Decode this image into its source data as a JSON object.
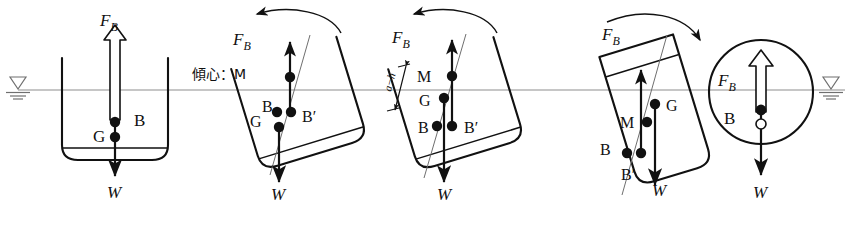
{
  "figure": {
    "background_color": "#ffffff",
    "line_color": "#111111",
    "waterline_color": "#8d8d8d",
    "width": 862,
    "height": 230,
    "waterline_y": 90,
    "caption_partial": "",
    "water_symbol_left": "water-level-symbol",
    "water_symbol_right": "water-level-symbol"
  },
  "labels": {
    "buoyancy_force": "F",
    "buoyancy_force_sub": "B",
    "weight": "W",
    "center_of_gravity": "G",
    "center_of_buoyancy": "B",
    "center_of_buoyancy_shifted": "B′",
    "metacenter": "M",
    "metacenter_jp": "傾心：M",
    "dimension_gm": "a−h"
  },
  "panels": [
    {
      "id": "panel-1-upright",
      "name": "upright-hull",
      "hull_type": "wide-box",
      "tilt_deg": 0,
      "rotation_arrow": "none",
      "points": [
        {
          "label": "B",
          "kind": "filled"
        },
        {
          "label": "G",
          "kind": "filled"
        }
      ],
      "force_up": "F_B",
      "force_down": "W"
    },
    {
      "id": "panel-2-tilted-stable",
      "name": "tilted-hull-stable-metacenter",
      "hull_type": "wide-box",
      "tilt_deg": -17,
      "rotation_arrow": "counter-clockwise",
      "points": [
        {
          "label": "M",
          "kind": "filled"
        },
        {
          "label": "B",
          "kind": "filled"
        },
        {
          "label": "B′",
          "kind": "filled"
        },
        {
          "label": "G",
          "kind": "filled"
        }
      ],
      "annotation": "傾心：M",
      "force_up": "F_B",
      "force_down": "W"
    },
    {
      "id": "panel-3-tilted-stable-gm",
      "name": "tilted-hull-with-gm-dimension",
      "hull_type": "wide-box",
      "tilt_deg": -17,
      "rotation_arrow": "counter-clockwise",
      "points": [
        {
          "label": "M",
          "kind": "filled"
        },
        {
          "label": "G",
          "kind": "filled"
        },
        {
          "label": "B",
          "kind": "filled"
        },
        {
          "label": "B′",
          "kind": "filled"
        }
      ],
      "dimension": "a−h",
      "force_up": "F_B",
      "force_down": "W"
    },
    {
      "id": "panel-4-tilted-unstable",
      "name": "tilted-narrow-hull-unstable",
      "hull_type": "narrow-tall",
      "tilt_deg": -17,
      "rotation_arrow": "clockwise",
      "points": [
        {
          "label": "G",
          "kind": "filled"
        },
        {
          "label": "M",
          "kind": "filled"
        },
        {
          "label": "B",
          "kind": "filled"
        },
        {
          "label": "B′",
          "kind": "filled"
        }
      ],
      "force_up": "F_B",
      "force_down": "W"
    },
    {
      "id": "panel-5-circular",
      "name": "circular-float-neutral",
      "hull_type": "circle",
      "tilt_deg": 0,
      "rotation_arrow": "none",
      "points": [
        {
          "label": "B",
          "kind": "filled"
        },
        {
          "label": "G",
          "kind": "open"
        }
      ],
      "force_up": "F_B",
      "force_down": "W"
    }
  ]
}
